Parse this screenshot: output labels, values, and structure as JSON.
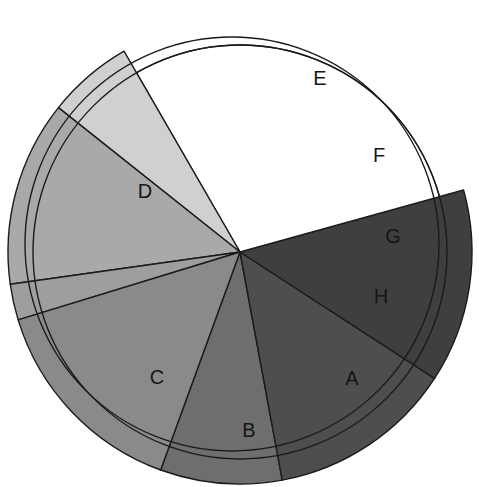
{
  "chart_data": {
    "type": "pie",
    "title": "",
    "subtitle": "",
    "xlabel": "",
    "ylabel": "",
    "grid": false,
    "legend": "none",
    "labels_inside_slices": true,
    "start_angle_deg": 0,
    "direction": "counterclockwise",
    "total_percent": 100,
    "categories": [
      "A",
      "B",
      "C",
      "D",
      "E",
      "F",
      "G",
      "H"
    ],
    "values": [
      8.5,
      13.0,
      13.5,
      29.0,
      6.0,
      13.0,
      2.5,
      14.5
    ],
    "units": "percent",
    "slices": [
      {
        "label": "A",
        "value": 8.5,
        "color": "#6e6e6e",
        "start_angle_deg": 250.0,
        "end_angle_deg": 280.5,
        "exploded": false,
        "extends_past_inner_circle": true
      },
      {
        "label": "B",
        "value": 13.0,
        "color": "#4e4e4e",
        "start_angle_deg": 280.5,
        "end_angle_deg": 327.0,
        "exploded": false,
        "extends_past_inner_circle": true
      },
      {
        "label": "C",
        "value": 13.5,
        "color": "#3f3f3f",
        "start_angle_deg": 327.0,
        "end_angle_deg": 15.5,
        "exploded": false,
        "extends_past_inner_circle": true
      },
      {
        "label": "D",
        "value": 29.0,
        "color": "#ffffff",
        "start_angle_deg": 15.5,
        "end_angle_deg": 120.0,
        "exploded": true,
        "extends_past_inner_circle": false
      },
      {
        "label": "E",
        "value": 6.0,
        "color": "#d0d0d0",
        "start_angle_deg": 120.0,
        "end_angle_deg": 141.5,
        "exploded": false,
        "extends_past_inner_circle": true
      },
      {
        "label": "F",
        "value": 13.0,
        "color": "#a9a9a9",
        "start_angle_deg": 141.5,
        "end_angle_deg": 188.0,
        "exploded": false,
        "extends_past_inner_circle": true
      },
      {
        "label": "G",
        "value": 2.5,
        "color": "#9e9e9e",
        "start_angle_deg": 188.0,
        "end_angle_deg": 197.0,
        "exploded": false,
        "extends_past_inner_circle": true
      },
      {
        "label": "H",
        "value": 14.5,
        "color": "#8a8a8a",
        "start_angle_deg": 197.0,
        "end_angle_deg": 250.0,
        "exploded": false,
        "extends_past_inner_circle": true
      }
    ],
    "geometry": {
      "center_x": 240,
      "center_y": 252,
      "inner_circle_radius": 207,
      "slice_radius": 232,
      "offset_circle_center_x": 232,
      "offset_circle_center_y": 244,
      "offset_circle_radius": 207,
      "outline_color": "#1b1b1b",
      "outline_width": 1.4,
      "background": "#ffffff"
    },
    "label_positions": [
      {
        "label": "A",
        "x": 352,
        "y": 380
      },
      {
        "label": "B",
        "x": 249,
        "y": 432
      },
      {
        "label": "C",
        "x": 157,
        "y": 379
      },
      {
        "label": "D",
        "x": 145,
        "y": 193
      },
      {
        "label": "E",
        "x": 320,
        "y": 80
      },
      {
        "label": "F",
        "x": 379,
        "y": 157
      },
      {
        "label": "G",
        "x": 393,
        "y": 238
      },
      {
        "label": "H",
        "x": 381,
        "y": 298
      }
    ]
  }
}
